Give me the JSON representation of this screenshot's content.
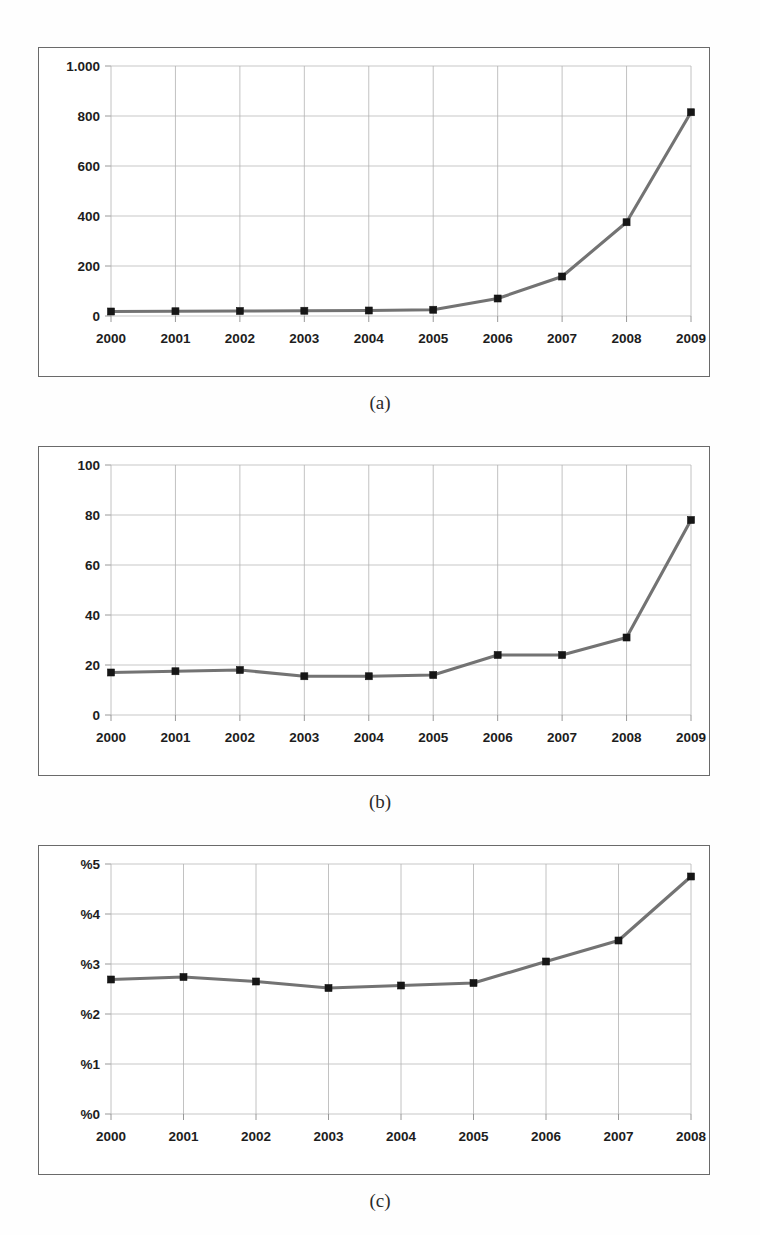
{
  "figure": {
    "captions": {
      "a": "(a)",
      "b": "(b)",
      "c": "(c)"
    }
  },
  "chart_data": [
    {
      "id": "chart-a",
      "type": "line",
      "title": "",
      "subfigure_label": "(a)",
      "xlabel": "",
      "ylabel": "",
      "categories": [
        "2000",
        "2001",
        "2002",
        "2003",
        "2004",
        "2005",
        "2006",
        "2007",
        "2008",
        "2009"
      ],
      "values": [
        18,
        19,
        20,
        21,
        22,
        25,
        70,
        158,
        375,
        815
      ],
      "ytick_labels": [
        "0",
        "200",
        "400",
        "600",
        "800",
        "1.000"
      ],
      "ytick_values": [
        0,
        200,
        400,
        600,
        800,
        1000
      ],
      "ylim": [
        0,
        1000
      ],
      "grid": true,
      "legend": "none",
      "marker": "square",
      "line_color": "#737373",
      "marker_color": "#161616"
    },
    {
      "id": "chart-b",
      "type": "line",
      "title": "",
      "subfigure_label": "(b)",
      "xlabel": "",
      "ylabel": "",
      "categories": [
        "2000",
        "2001",
        "2002",
        "2003",
        "2004",
        "2005",
        "2006",
        "2007",
        "2008",
        "2009"
      ],
      "values": [
        17,
        17.5,
        18,
        15.5,
        15.5,
        16,
        24,
        24,
        31,
        78
      ],
      "ytick_labels": [
        "0",
        "20",
        "40",
        "60",
        "80",
        "100"
      ],
      "ytick_values": [
        0,
        20,
        40,
        60,
        80,
        100
      ],
      "ylim": [
        0,
        100
      ],
      "grid": true,
      "legend": "none",
      "marker": "square",
      "line_color": "#737373",
      "marker_color": "#161616"
    },
    {
      "id": "chart-c",
      "type": "line",
      "title": "",
      "subfigure_label": "(c)",
      "xlabel": "",
      "ylabel": "",
      "categories": [
        "2000",
        "2001",
        "2002",
        "2003",
        "2004",
        "2005",
        "2006",
        "2007",
        "2008"
      ],
      "values": [
        2.69,
        2.74,
        2.65,
        2.52,
        2.57,
        2.62,
        3.05,
        3.47,
        4.75
      ],
      "ytick_labels": [
        "%0",
        "%1",
        "%2",
        "%3",
        "%4",
        "%5"
      ],
      "ytick_values": [
        0,
        1,
        2,
        3,
        4,
        5
      ],
      "ylim": [
        0,
        5
      ],
      "grid": true,
      "legend": "none",
      "marker": "square",
      "line_color": "#737373",
      "marker_color": "#161616"
    }
  ]
}
